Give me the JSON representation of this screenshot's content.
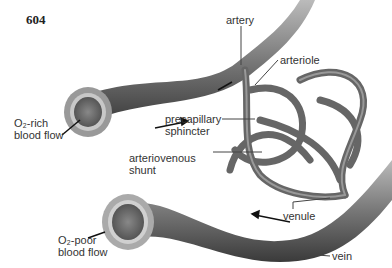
{
  "page_number": "604",
  "labels": {
    "artery": "artery",
    "arteriole": "arteriole",
    "precapillary_line1": "precapillary",
    "precapillary_line2": "sphincter",
    "shunt_line1": "arteriovenous",
    "shunt_line2": "shunt",
    "o2_rich_line1": "O₂-rich",
    "o2_rich_line2": "blood flow",
    "o2_poor_line1": "O₂-poor",
    "o2_poor_line2": "blood flow",
    "venule": "venule",
    "vein": "vein"
  }
}
